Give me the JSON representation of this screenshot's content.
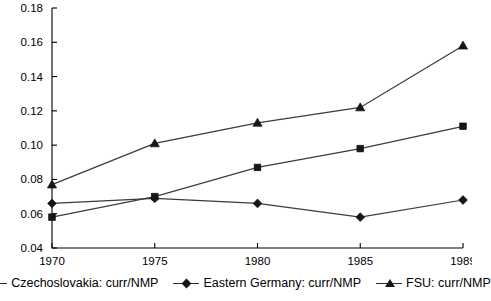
{
  "chart_data": {
    "type": "line",
    "title": "",
    "xlabel": "",
    "ylabel": "",
    "categories": [
      "1970",
      "1975",
      "1980",
      "1985",
      "1989"
    ],
    "x_tick_labels": [
      "1970",
      "1975",
      "1980",
      "1985",
      "1989"
    ],
    "y_tick_labels": [
      "0.04",
      "0.06",
      "0.08",
      "0.10",
      "0.12",
      "0.14",
      "0.16",
      "0.18"
    ],
    "y_ticks": [
      0.04,
      0.06,
      0.08,
      0.1,
      0.12,
      0.14,
      0.16,
      0.18
    ],
    "ylim": [
      0.04,
      0.18
    ],
    "grid": false,
    "legend_position": "bottom",
    "series": [
      {
        "name": "Czechoslovakia: curr/NMP",
        "marker": "square",
        "values": [
          0.058,
          0.07,
          0.087,
          0.098,
          0.111
        ]
      },
      {
        "name": "Eastern Germany: curr/NMP",
        "marker": "diamond",
        "values": [
          0.066,
          0.069,
          0.066,
          0.058,
          0.068
        ]
      },
      {
        "name": "FSU: curr/NMP",
        "marker": "triangle",
        "values": [
          0.077,
          0.101,
          0.113,
          0.122,
          0.158
        ]
      }
    ]
  },
  "legend": {
    "items": [
      {
        "label": "Czechoslovakia: curr/NMP",
        "marker": "square"
      },
      {
        "label": "Eastern Germany: curr/NMP",
        "marker": "diamond"
      },
      {
        "label": "FSU: curr/NMP",
        "marker": "triangle"
      }
    ]
  },
  "colors": {
    "line": "#3a3a42",
    "marker": "#16161a",
    "axis": "#000000",
    "background": "#ffffff"
  }
}
